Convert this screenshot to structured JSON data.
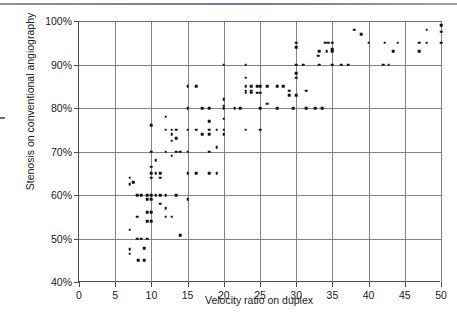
{
  "figure": {
    "decor": {
      "top_rule_color": "#6c7a99",
      "axis_color": "#4d4d4d",
      "grid_color": "#828282",
      "marker_color": "#111111"
    }
  },
  "chart_data": {
    "type": "scatter",
    "title": "",
    "xlabel": "Velocity ratio on duplex",
    "ylabel": "Stenosis on conventional angiography",
    "xlim": [
      0,
      50
    ],
    "ylim": [
      40,
      100
    ],
    "xticks": [
      0,
      5,
      10,
      15,
      20,
      25,
      30,
      35,
      40,
      45,
      50
    ],
    "xtick_labels": [
      "0",
      "5",
      "10",
      "15",
      "20",
      "25",
      "30",
      "35",
      "40",
      "45",
      "50"
    ],
    "yticks": [
      40,
      50,
      60,
      70,
      80,
      90,
      100
    ],
    "ytick_labels": [
      "40%",
      "50%",
      "60%",
      "70%",
      "80%",
      "90%",
      "100%"
    ],
    "grid": "both",
    "legend": "none",
    "marker": "square",
    "points": [
      [
        7.0,
        64.0
      ],
      [
        7.0,
        62.5
      ],
      [
        7.5,
        63.0
      ],
      [
        7.0,
        52.0
      ],
      [
        7.0,
        47.5
      ],
      [
        7.0,
        46.5
      ],
      [
        8.0,
        60.0
      ],
      [
        8.0,
        55.0
      ],
      [
        8.0,
        50.0
      ],
      [
        8.2,
        45.0
      ],
      [
        8.6,
        60.0
      ],
      [
        8.6,
        50.0
      ],
      [
        9.0,
        45.0
      ],
      [
        9.0,
        47.8
      ],
      [
        9.4,
        60.0
      ],
      [
        9.4,
        59.0
      ],
      [
        9.4,
        56.0
      ],
      [
        9.4,
        54.0
      ],
      [
        9.4,
        50.0
      ],
      [
        10.0,
        76.0
      ],
      [
        10.0,
        70.0
      ],
      [
        10.0,
        66.5
      ],
      [
        10.0,
        65.0
      ],
      [
        10.0,
        64.0
      ],
      [
        10.0,
        60.0
      ],
      [
        10.0,
        59.0
      ],
      [
        10.0,
        56.0
      ],
      [
        10.0,
        54.0
      ],
      [
        10.6,
        60.0
      ],
      [
        10.6,
        65.0
      ],
      [
        10.6,
        68.0
      ],
      [
        11.2,
        60.0
      ],
      [
        11.2,
        58.0
      ],
      [
        11.2,
        65.0
      ],
      [
        11.2,
        64.0
      ],
      [
        12.0,
        78.0
      ],
      [
        12.0,
        75.0
      ],
      [
        12.0,
        70.0
      ],
      [
        12.0,
        60.0
      ],
      [
        12.0,
        57.0
      ],
      [
        12.0,
        55.0
      ],
      [
        12.8,
        75.0
      ],
      [
        12.8,
        74.0
      ],
      [
        12.8,
        72.5
      ],
      [
        12.8,
        69.0
      ],
      [
        12.8,
        55.0
      ],
      [
        13.4,
        75.0
      ],
      [
        13.4,
        73.0
      ],
      [
        13.4,
        70.0
      ],
      [
        13.4,
        60.0
      ],
      [
        14.0,
        70.0
      ],
      [
        14.0,
        50.8
      ],
      [
        15.0,
        85.0
      ],
      [
        15.0,
        80.0
      ],
      [
        15.0,
        75.0
      ],
      [
        15.0,
        70.0
      ],
      [
        15.0,
        65.0
      ],
      [
        15.0,
        59.0
      ],
      [
        16.2,
        85.0
      ],
      [
        16.2,
        75.0
      ],
      [
        16.2,
        65.0
      ],
      [
        17.0,
        80.0
      ],
      [
        17.0,
        74.0
      ],
      [
        18.0,
        80.0
      ],
      [
        18.0,
        77.0
      ],
      [
        18.0,
        75.0
      ],
      [
        18.0,
        74.0
      ],
      [
        18.0,
        70.0
      ],
      [
        18.0,
        65.0
      ],
      [
        19.0,
        75.0
      ],
      [
        19.0,
        71.0
      ],
      [
        19.0,
        65.0
      ],
      [
        20.0,
        90.0
      ],
      [
        20.0,
        82.0
      ],
      [
        20.0,
        80.5
      ],
      [
        20.0,
        80.0
      ],
      [
        20.0,
        77.5
      ],
      [
        20.0,
        75.0
      ],
      [
        20.0,
        74.0
      ],
      [
        21.5,
        80.0
      ],
      [
        22.3,
        80.0
      ],
      [
        23.0,
        90.0
      ],
      [
        23.0,
        87.0
      ],
      [
        23.0,
        85.0
      ],
      [
        23.0,
        84.0
      ],
      [
        23.0,
        83.5
      ],
      [
        23.8,
        85.0
      ],
      [
        23.8,
        84.0
      ],
      [
        23.8,
        83.5
      ],
      [
        23.0,
        75.0
      ],
      [
        24.6,
        85.0
      ],
      [
        24.6,
        83.5
      ],
      [
        25.0,
        85.0
      ],
      [
        25.0,
        83.5
      ],
      [
        25.0,
        80.0
      ],
      [
        25.0,
        75.0
      ],
      [
        26.0,
        85.0
      ],
      [
        26.0,
        81.0
      ],
      [
        27.4,
        85.0
      ],
      [
        28.2,
        85.0
      ],
      [
        27.4,
        80.0
      ],
      [
        29.0,
        84.0
      ],
      [
        29.0,
        83.0
      ],
      [
        29.6,
        80.0
      ],
      [
        30.0,
        95.0
      ],
      [
        30.0,
        94.0
      ],
      [
        30.0,
        90.0
      ],
      [
        30.0,
        88.0
      ],
      [
        30.0,
        87.0
      ],
      [
        30.0,
        83.0
      ],
      [
        31.0,
        90.0
      ],
      [
        31.4,
        84.0
      ],
      [
        31.4,
        80.0
      ],
      [
        32.6,
        80.0
      ],
      [
        33.0,
        92.0
      ],
      [
        33.2,
        93.0
      ],
      [
        33.2,
        90.0
      ],
      [
        33.6,
        80.0
      ],
      [
        34.0,
        95.0
      ],
      [
        34.4,
        95.0
      ],
      [
        34.2,
        93.0
      ],
      [
        35.0,
        95.0
      ],
      [
        35.0,
        93.5
      ],
      [
        35.0,
        93.0
      ],
      [
        35.0,
        90.0
      ],
      [
        36.2,
        90.0
      ],
      [
        37.2,
        90.0
      ],
      [
        38.0,
        98.0
      ],
      [
        39.0,
        97.0
      ],
      [
        40.0,
        95.0
      ],
      [
        42.0,
        90.0
      ],
      [
        42.8,
        90.0
      ],
      [
        42.2,
        95.0
      ],
      [
        43.4,
        93.0
      ],
      [
        44.0,
        95.0
      ],
      [
        47.0,
        95.0
      ],
      [
        47.0,
        93.0
      ],
      [
        48.0,
        98.0
      ],
      [
        48.0,
        95.0
      ],
      [
        50.0,
        99.0
      ],
      [
        50.0,
        97.5
      ],
      [
        50.0,
        95.0
      ]
    ]
  }
}
